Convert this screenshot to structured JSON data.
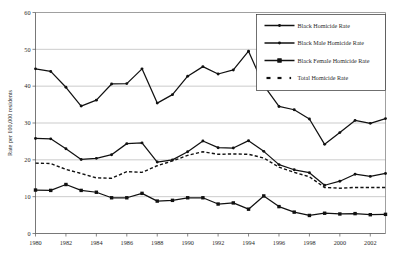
{
  "chart_data": {
    "type": "line",
    "title": "",
    "xlabel": "",
    "ylabel": "Rate per 100,000 residents",
    "ylim": [
      0,
      60
    ],
    "yticks": [
      0,
      10,
      20,
      30,
      40,
      50,
      60
    ],
    "ytick_labels": [
      "0",
      "10",
      "20",
      "30",
      "40",
      "50",
      "60"
    ],
    "xlim": [
      1980,
      2003
    ],
    "xticks": [
      1980,
      1982,
      1984,
      1986,
      1988,
      1990,
      1992,
      1994,
      1996,
      1998,
      2000,
      2002
    ],
    "xtick_labels": [
      "1980",
      "1982",
      "1984",
      "1986",
      "1988",
      "1990",
      "1992",
      "1994",
      "1996",
      "1998",
      "2000",
      "2002"
    ],
    "grid": true,
    "grid_axis": "y",
    "legend_position": "top-right",
    "x": [
      1980,
      1981,
      1982,
      1983,
      1984,
      1985,
      1986,
      1987,
      1988,
      1989,
      1990,
      1991,
      1992,
      1993,
      1994,
      1995,
      1996,
      1997,
      1998,
      1999,
      2000,
      2001,
      2002,
      2003
    ],
    "series": [
      {
        "name": "Black Male Homicide Rate",
        "style": "solid",
        "marker": "diamond",
        "values": [
          44.7,
          44.0,
          39.7,
          34.6,
          36.2,
          40.6,
          40.7,
          44.7,
          35.4,
          37.7,
          42.7,
          45.3,
          43.3,
          44.4,
          49.5,
          40.2,
          34.5,
          33.6,
          31.1,
          24.2,
          27.4,
          30.7,
          29.9,
          31.2
        ]
      },
      {
        "name": "Black Homicide Rate",
        "style": "solid",
        "marker": "diamond",
        "values": [
          25.8,
          25.7,
          23.0,
          20.1,
          20.4,
          21.4,
          24.4,
          24.6,
          19.4,
          20.0,
          22.2,
          25.1,
          23.3,
          23.2,
          25.2,
          22.3,
          18.7,
          17.3,
          16.5,
          13.1,
          14.2,
          16.1,
          15.5,
          16.3
        ]
      },
      {
        "name": "Total Homicide Rate",
        "style": "dashed",
        "marker": "none",
        "values": [
          19.1,
          19.0,
          17.4,
          16.3,
          15.1,
          15.0,
          16.8,
          16.6,
          18.4,
          19.7,
          21.2,
          22.2,
          21.5,
          21.6,
          21.5,
          20.5,
          18.0,
          16.6,
          15.4,
          12.5,
          12.3,
          12.5,
          12.5,
          12.5
        ]
      },
      {
        "name": "Black Female Homicide Rate",
        "style": "solid",
        "marker": "square",
        "values": [
          11.8,
          11.7,
          13.3,
          11.7,
          11.2,
          9.7,
          9.7,
          10.9,
          8.8,
          9.0,
          9.7,
          9.7,
          8.0,
          8.3,
          6.6,
          10.2,
          7.3,
          5.8,
          4.9,
          5.5,
          5.3,
          5.4,
          5.1,
          5.2
        ]
      }
    ],
    "legend": [
      {
        "label": "Black Homicide Rate",
        "marker": "diamond",
        "style": "solid"
      },
      {
        "label": "Black Male Homicide Rate",
        "marker": "diamond",
        "style": "solid"
      },
      {
        "label": "Black Female Homicide Rate",
        "marker": "square",
        "style": "solid"
      },
      {
        "label": "Total Homicide Rate",
        "marker": "dash",
        "style": "dashed"
      }
    ],
    "colors": {
      "line": "#111111",
      "grid": "#aaaaaa",
      "axis": "#555555",
      "text": "#2b2b2b",
      "background": "#ffffff"
    }
  }
}
